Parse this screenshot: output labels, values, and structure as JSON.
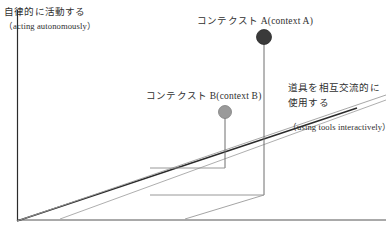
{
  "figure": {
    "type": "diagram",
    "background_color": "#ffffff",
    "line_color_dark": "#2b2b2b",
    "line_color_light": "#8d8d8d"
  },
  "labels": {
    "autonomy": {
      "jp": "自律的に活動する",
      "en": "（acting autonomously）"
    },
    "context_a": {
      "text": "コンテクスト A(context A)"
    },
    "context_b": {
      "text": "コンテクスト B(context B)"
    },
    "tools": {
      "jp_line1": "道具を相互交流的に",
      "jp_line2": "使用する",
      "en": "（using tools interactively）"
    }
  },
  "markers": [
    {
      "name": "context-a",
      "color": "#3a3a3a",
      "x": 264,
      "y": 37,
      "radius": 7.5,
      "drop_line_to_y": 195
    },
    {
      "name": "context-b",
      "color": "#9a9a9a",
      "x": 225,
      "y": 112,
      "radius": 6.5,
      "drop_line_to_y": 168
    }
  ],
  "axes": {
    "vertical": {
      "x": 17,
      "y_top": 10,
      "y_bottom": 221
    },
    "baseline": {
      "y": 220,
      "x_left": 17,
      "x_right": 386
    },
    "depth_diagonal_main": {
      "x1": 17,
      "y1": 221,
      "x2": 357,
      "y2": 108
    },
    "depth_diagonal_secondary": {
      "x1": 17,
      "y1": 221,
      "x2": 386,
      "y2": 95
    },
    "depth_diagonal_lower": {
      "x1": 60,
      "y1": 219,
      "x2": 386,
      "y2": 100
    }
  }
}
